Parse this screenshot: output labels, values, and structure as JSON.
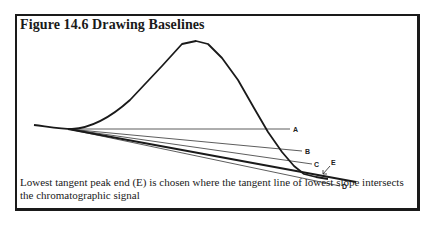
{
  "figure": {
    "title": "Figure 14.6  Drawing Baselines",
    "caption": "Lowest tangent peak end (E) is chosen where the tangent line of lowest slope intersects the chromatographic signal",
    "labels": {
      "a": "A",
      "b": "B",
      "c": "C",
      "d": "D",
      "e": "E"
    }
  }
}
